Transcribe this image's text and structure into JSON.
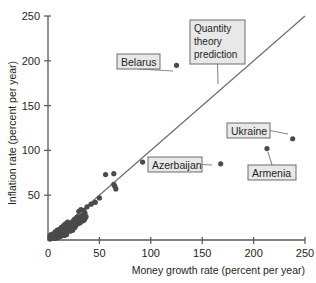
{
  "chart_data": {
    "type": "scatter",
    "title": "",
    "xlabel": "Money growth rate (percent per year)",
    "ylabel": "Inflation rate (percent per year)",
    "xlim": [
      0,
      250
    ],
    "ylim": [
      0,
      250
    ],
    "xticks": [
      "0",
      "50",
      "100",
      "150",
      "200",
      "250"
    ],
    "yticks": [
      "50",
      "100",
      "150",
      "200",
      "250"
    ],
    "xtick_values": [
      0,
      50,
      100,
      150,
      200,
      250
    ],
    "ytick_values": [
      50,
      100,
      150,
      200,
      250
    ],
    "grid": false,
    "legend": "none",
    "series": [
      {
        "name": "Countries",
        "points": [
          [
            125,
            195
          ],
          [
            168,
            85
          ],
          [
            213,
            102
          ],
          [
            238,
            113
          ],
          [
            92,
            87
          ],
          [
            65,
            60
          ],
          [
            66,
            57
          ],
          [
            64,
            62
          ],
          [
            56,
            73
          ],
          [
            64,
            74
          ],
          [
            50,
            47
          ],
          [
            46,
            42
          ],
          [
            42,
            40
          ],
          [
            38,
            37
          ],
          [
            36,
            30
          ],
          [
            34,
            28
          ],
          [
            33,
            27
          ],
          [
            32,
            26
          ],
          [
            31,
            24
          ],
          [
            30,
            23
          ],
          [
            29,
            26
          ],
          [
            28,
            22
          ],
          [
            27,
            20
          ],
          [
            26,
            14
          ],
          [
            25,
            19
          ],
          [
            24,
            18
          ],
          [
            23,
            17
          ],
          [
            22,
            16
          ],
          [
            21,
            15
          ],
          [
            20,
            14
          ],
          [
            19,
            13
          ],
          [
            18,
            12
          ],
          [
            17,
            12
          ],
          [
            16,
            11
          ],
          [
            15,
            10
          ],
          [
            14,
            10
          ],
          [
            13,
            9
          ],
          [
            12,
            9
          ],
          [
            11,
            8
          ],
          [
            10,
            8
          ],
          [
            10,
            6
          ],
          [
            9,
            7
          ],
          [
            9,
            5
          ],
          [
            8,
            7
          ],
          [
            8,
            4
          ],
          [
            7,
            6
          ],
          [
            7,
            3
          ],
          [
            6,
            6
          ],
          [
            6,
            4
          ],
          [
            5,
            5
          ],
          [
            5,
            3
          ],
          [
            4,
            4
          ],
          [
            4,
            2
          ],
          [
            3,
            4
          ],
          [
            3,
            2
          ],
          [
            2,
            3
          ],
          [
            2,
            1
          ],
          [
            12,
            6
          ],
          [
            14,
            7
          ],
          [
            16,
            8
          ],
          [
            18,
            9
          ],
          [
            20,
            10
          ],
          [
            11,
            12
          ],
          [
            13,
            14
          ],
          [
            15,
            16
          ],
          [
            17,
            18
          ],
          [
            19,
            20
          ],
          [
            21,
            12
          ],
          [
            23,
            13
          ],
          [
            25,
            15
          ],
          [
            27,
            16
          ],
          [
            29,
            18
          ],
          [
            31,
            19
          ],
          [
            33,
            21
          ],
          [
            35,
            22
          ],
          [
            30,
            32
          ],
          [
            32,
            34
          ],
          [
            34,
            22
          ],
          [
            36,
            24
          ],
          [
            9,
            11
          ],
          [
            7,
            9
          ],
          [
            5,
            7
          ],
          [
            3,
            6
          ],
          [
            6,
            2
          ],
          [
            8,
            2
          ],
          [
            10,
            3
          ],
          [
            12,
            4
          ],
          [
            14,
            5
          ],
          [
            16,
            5
          ],
          [
            18,
            6
          ],
          [
            4,
            6
          ],
          [
            2,
            5
          ],
          [
            11,
            11
          ],
          [
            13,
            11
          ],
          [
            15,
            13
          ],
          [
            17,
            14
          ],
          [
            19,
            15
          ],
          [
            21,
            17
          ],
          [
            23,
            19
          ],
          [
            25,
            21
          ],
          [
            22,
            10
          ],
          [
            24,
            11
          ],
          [
            26,
            23
          ],
          [
            28,
            25
          ],
          [
            35,
            33
          ],
          [
            37,
            26
          ]
        ]
      }
    ],
    "reference_line": {
      "name": "Quantity theory prediction",
      "from": [
        0,
        0
      ],
      "to": [
        250,
        250
      ],
      "slope": 1,
      "intercept": 0
    },
    "annotations": [
      {
        "label": "Belarus",
        "point": [
          125,
          195
        ],
        "box_x": 117,
        "box_y": 54,
        "box_w": 43,
        "box_h": 15,
        "anchor_x": 173,
        "anchor_y": 71,
        "lines": [
          "Belarus"
        ]
      },
      {
        "label": "Quantity theory prediction",
        "point": null,
        "box_x": 190,
        "box_y": 20,
        "box_w": 55,
        "box_h": 44,
        "anchor_x": 218,
        "anchor_y": 84,
        "lines": [
          "Quantity",
          "theory",
          "prediction"
        ]
      },
      {
        "label": "Ukraine",
        "point": [
          238,
          113
        ],
        "box_x": 227,
        "box_y": 123,
        "box_w": 43,
        "box_h": 15,
        "anchor_x": 288,
        "anchor_y": 134,
        "lines": [
          "Ukraine"
        ]
      },
      {
        "label": "Armenia",
        "point": [
          213,
          102
        ],
        "box_x": 248,
        "box_y": 165,
        "box_w": 48,
        "box_h": 15,
        "anchor_x": 268,
        "anchor_y": 152,
        "lines": [
          "Armenia"
        ]
      },
      {
        "label": "Azerbaijan",
        "point": [
          168,
          85
        ],
        "box_x": 148,
        "box_y": 157,
        "box_w": 54,
        "box_h": 15,
        "anchor_x": 212,
        "anchor_y": 165,
        "lines": [
          "Azerbaijan"
        ]
      }
    ],
    "colors": {
      "point": "#4a4a4c",
      "line": "#6d6d6f",
      "axis": "#58585a",
      "callout_fill": "#e8e8e8",
      "callout_stroke": "#6d6d6f",
      "text": "#231f20",
      "background": "#ffffff"
    }
  }
}
